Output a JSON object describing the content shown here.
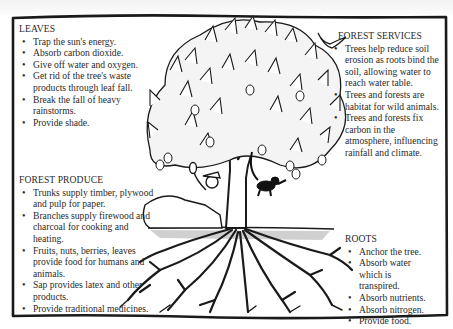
{
  "diagram": {
    "illustration": {
      "elements": [
        "mango-tree",
        "man-reclining-eating-fruit",
        "monkey-hanging",
        "bird-flying",
        "roots-underground"
      ]
    }
  },
  "leaves": {
    "title": "LEAVES",
    "items": [
      "Trap the sun's energy.",
      "Absorb carbon dioxide.",
      "Give off water and oxygen.",
      "Get rid of the tree's waste products through leaf fall.",
      "Break the fall of heavy rainstorms.",
      "Provide shade."
    ]
  },
  "forest_produce": {
    "title": "FOREST PRODUCE",
    "items": [
      "Trunks supply timber, plywood and pulp for paper.",
      "Branches supply firewood and charcoal for cooking and heating.",
      "Fruits, nuts, berries, leaves provide food for humans and animals.",
      "Sap provides latex and other products.",
      "Provide traditional medicines."
    ]
  },
  "forest_services": {
    "title": "FOREST SERVICES",
    "items": [
      "Trees help reduce soil erosion as roots bind the soil, allowing water to reach water table.",
      "Trees and forests are habitat for wild animals.",
      "Trees and forests fix carbon in the atmosphere, influencing rainfall and climate."
    ]
  },
  "roots": {
    "title": "ROOTS",
    "items": [
      "Anchor the tree.",
      "Absorb water which is transpired.",
      "Absorb nutrients.",
      "Absorb nitrogen.",
      "Provide food."
    ]
  },
  "colors": {
    "ink": "#1a1a1a",
    "paper": "#ffffff",
    "text": "#2a2a2a"
  }
}
